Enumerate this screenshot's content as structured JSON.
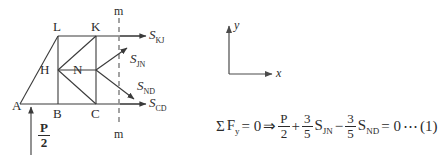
{
  "figure": {
    "truss": {
      "nodes": [
        {
          "name": "A",
          "label": "A",
          "x": 20,
          "y": 104
        },
        {
          "name": "B",
          "label": "B",
          "x": 58,
          "y": 104
        },
        {
          "name": "C",
          "label": "C",
          "x": 96,
          "y": 104
        },
        {
          "name": "L",
          "label": "L",
          "x": 58,
          "y": 36
        },
        {
          "name": "K",
          "label": "K",
          "x": 96,
          "y": 36
        },
        {
          "name": "H",
          "label": "H",
          "x": 58,
          "y": 70
        },
        {
          "name": "N",
          "label": "N",
          "x": 96,
          "y": 70
        }
      ],
      "section_line": {
        "label_top": "m",
        "label_bottom": "m",
        "x": 119
      }
    },
    "forces": [
      {
        "name": "S_KJ",
        "base": "S",
        "sub": "KJ"
      },
      {
        "name": "S_JN",
        "base": "S",
        "sub": "JN"
      },
      {
        "name": "S_ND",
        "base": "S",
        "sub": "ND"
      },
      {
        "name": "S_CD",
        "base": "S",
        "sub": "CD"
      }
    ],
    "reaction": {
      "numerator": "P",
      "denominator": "2"
    },
    "axes": {
      "x_label": "x",
      "y_label": "y"
    }
  },
  "equation": {
    "sigma": "Σ",
    "force_sum": "F",
    "force_sum_sub": "y",
    "equals_zero": "= 0",
    "implies": "⇒",
    "term1": {
      "numerator": "P",
      "denominator": "2"
    },
    "plus": "+",
    "term2": {
      "numerator": "3",
      "denominator": "5",
      "var": "S",
      "sub": "JN"
    },
    "minus": "−",
    "term3": {
      "numerator": "3",
      "denominator": "5",
      "var": "S",
      "sub": "ND"
    },
    "result": "= 0",
    "dots": "⋯",
    "tag": "(1)"
  },
  "colors": {
    "line": "#3a3a3a",
    "dashed": "#8c8c8c",
    "text": "#2b2b2b",
    "background": "#ffffff"
  }
}
